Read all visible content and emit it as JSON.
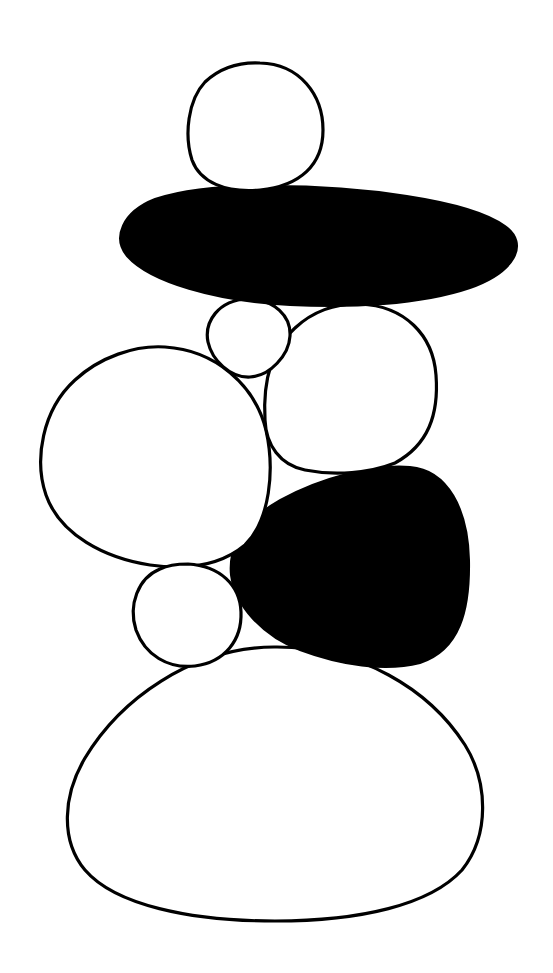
{
  "figure": {
    "background_color": "#ffffff",
    "stroke_color": "#000000",
    "fill_dark": "#000000",
    "stones": [
      {
        "id": "top-stone",
        "style": "outline"
      },
      {
        "id": "flat-black-stone",
        "style": "solid"
      },
      {
        "id": "small-upper-stone",
        "style": "outline"
      },
      {
        "id": "right-middle-stone",
        "style": "outline"
      },
      {
        "id": "left-large-stone",
        "style": "outline"
      },
      {
        "id": "black-rounded-stone",
        "style": "solid"
      },
      {
        "id": "small-lower-stone",
        "style": "outline"
      },
      {
        "id": "base-dome-stone",
        "style": "outline"
      }
    ]
  }
}
